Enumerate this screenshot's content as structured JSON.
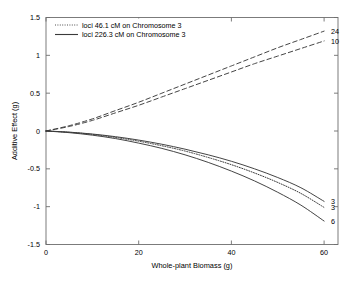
{
  "chart_data": {
    "type": "line",
    "title": "",
    "xlabel": "Whole-plant Biomass (g)",
    "ylabel": "Additive Effect (g)",
    "xlim": [
      0,
      63
    ],
    "ylim": [
      -1.5,
      1.5
    ],
    "xticks": [
      0,
      20,
      40,
      60
    ],
    "xtick_labels": [
      "0",
      "20",
      "40",
      "60"
    ],
    "yticks": [
      -1.5,
      -1,
      -0.5,
      0,
      0.5,
      1,
      1.5
    ],
    "ytick_labels": [
      "-1.5",
      "-1",
      "-0.5",
      "0",
      "0.5",
      "1",
      "1.5"
    ],
    "grid": false,
    "legend_position": "top-left",
    "legend": [
      {
        "label": "loci 46.1 cM on Chromosome 3",
        "style": "dotted"
      },
      {
        "label": "loci 226.3 cM on Chromosome 3",
        "style": "solid"
      }
    ],
    "x": [
      0,
      5,
      10,
      15,
      20,
      25,
      30,
      35,
      40,
      45,
      50,
      55,
      60
    ],
    "series": [
      {
        "name": "24",
        "end_label": "24",
        "style": "dashed",
        "values": [
          0.0,
          0.07,
          0.16,
          0.27,
          0.38,
          0.5,
          0.62,
          0.74,
          0.86,
          0.98,
          1.1,
          1.21,
          1.32
        ]
      },
      {
        "name": "10",
        "end_label": "10",
        "style": "dashed",
        "values": [
          0.0,
          0.06,
          0.14,
          0.24,
          0.34,
          0.45,
          0.56,
          0.67,
          0.78,
          0.89,
          0.99,
          1.09,
          1.19
        ]
      },
      {
        "name": "3-solid",
        "end_label": "3",
        "style": "solid",
        "values": [
          0.0,
          -0.015,
          -0.04,
          -0.075,
          -0.12,
          -0.175,
          -0.24,
          -0.315,
          -0.4,
          -0.5,
          -0.615,
          -0.75,
          -0.93
        ]
      },
      {
        "name": "3-dotted",
        "end_label": "3",
        "style": "dotted",
        "values": [
          0.0,
          -0.017,
          -0.045,
          -0.085,
          -0.135,
          -0.195,
          -0.265,
          -0.35,
          -0.445,
          -0.555,
          -0.68,
          -0.825,
          -1.01
        ]
      },
      {
        "name": "6",
        "end_label": "6",
        "style": "solid",
        "values": [
          0.0,
          -0.022,
          -0.055,
          -0.1,
          -0.16,
          -0.23,
          -0.315,
          -0.415,
          -0.53,
          -0.66,
          -0.81,
          -0.98,
          -1.19
        ]
      }
    ],
    "colors": {
      "axis": "#5a5a5a",
      "curve": "#3a3a3a",
      "text": "#000000",
      "background": "#ffffff"
    }
  }
}
